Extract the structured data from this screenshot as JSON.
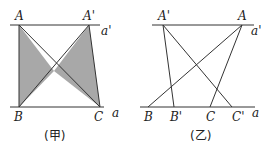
{
  "figures": [
    {
      "id": "jia",
      "caption": "(甲)",
      "top_line_label": "a'",
      "bottom_line_label": "a",
      "points": {
        "A": {
          "label": "A",
          "x": 19,
          "y": 25
        },
        "A_prime": {
          "label": "A'",
          "x": 89,
          "y": 25
        },
        "B": {
          "label": "B",
          "x": 19,
          "y": 107
        },
        "C": {
          "label": "C",
          "x": 100,
          "y": 107
        }
      },
      "shaded_regions": [
        "triangle ABO",
        "triangle A'OC"
      ],
      "fill_color": "#a8a8a8"
    },
    {
      "id": "yi",
      "caption": "(乙)",
      "top_line_label": "a'",
      "bottom_line_label": "a",
      "points": {
        "A_prime": {
          "label": "A'",
          "x": 163,
          "y": 25
        },
        "A": {
          "label": "A",
          "x": 242,
          "y": 25
        },
        "B": {
          "label": "B",
          "x": 148,
          "y": 107
        },
        "B_prime": {
          "label": "B'",
          "x": 174,
          "y": 107
        },
        "C": {
          "label": "C",
          "x": 210,
          "y": 107
        },
        "C_prime": {
          "label": "C'",
          "x": 232,
          "y": 107
        }
      }
    }
  ],
  "line_color": "#333333"
}
